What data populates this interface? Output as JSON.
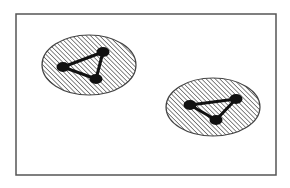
{
  "figure": {
    "frame": {
      "x": 16,
      "y": 14,
      "width": 260,
      "height": 161,
      "stroke": "#555555"
    },
    "hatch": {
      "stroke": "#555555",
      "spacing": 3.2
    },
    "node_color": "#111111",
    "groups": [
      {
        "name": "left-cluster",
        "ellipse": {
          "cx": 89,
          "cy": 65,
          "rx": 47,
          "ry": 30
        },
        "nodes": [
          {
            "x": 63,
            "y": 67,
            "r": 5
          },
          {
            "x": 103,
            "y": 52,
            "r": 5
          },
          {
            "x": 96,
            "y": 79,
            "r": 5
          }
        ],
        "edges": [
          [
            0,
            1
          ],
          [
            1,
            2
          ],
          [
            2,
            0
          ]
        ]
      },
      {
        "name": "right-cluster",
        "ellipse": {
          "cx": 213,
          "cy": 107,
          "rx": 47,
          "ry": 29
        },
        "nodes": [
          {
            "x": 190,
            "y": 105,
            "r": 5
          },
          {
            "x": 236,
            "y": 99,
            "r": 5
          },
          {
            "x": 216,
            "y": 120,
            "r": 5
          }
        ],
        "edges": [
          [
            0,
            1
          ],
          [
            1,
            2
          ],
          [
            2,
            0
          ]
        ]
      }
    ]
  }
}
